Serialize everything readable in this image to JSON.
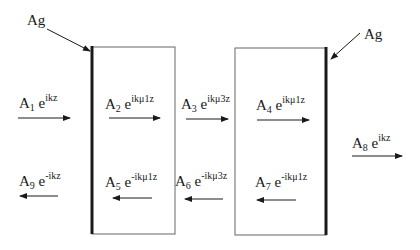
{
  "diagram": {
    "title": "",
    "colors": {
      "stroke": "#1a1a1a",
      "thin_edge": "#555555",
      "background": "#ffffff"
    },
    "slabs": [
      {
        "name": "slab-1",
        "x": 91,
        "y": 47,
        "w": 84,
        "h": 187,
        "thick_edge": "left",
        "coating_label": "Ag"
      },
      {
        "name": "slab-2",
        "x": 235,
        "y": 48,
        "w": 91,
        "h": 187,
        "thick_edge": "right",
        "coating_label": "Ag"
      }
    ],
    "ag_labels": [
      {
        "text": "Ag",
        "x": 26,
        "y": 14
      },
      {
        "text": "Ag",
        "x": 364,
        "y": 28
      }
    ],
    "waves": [
      {
        "id": "A1",
        "amp": "A",
        "sub": "1",
        "exp_base": "e",
        "exp": "ikz",
        "direction": "right",
        "region": "left-medium"
      },
      {
        "id": "A2",
        "amp": "A",
        "sub": "2",
        "exp_base": "e",
        "exp": "ikμ1z",
        "direction": "right",
        "region": "slab-1"
      },
      {
        "id": "A3",
        "amp": "A",
        "sub": "3",
        "exp_base": "e",
        "exp": "ikμ3z",
        "direction": "right",
        "region": "gap"
      },
      {
        "id": "A4",
        "amp": "A",
        "sub": "4",
        "exp_base": "e",
        "exp": "ikμ1z",
        "direction": "right",
        "region": "slab-2"
      },
      {
        "id": "A8",
        "amp": "A",
        "sub": "8",
        "exp_base": "e",
        "exp": "ikz",
        "direction": "right",
        "region": "right-medium"
      },
      {
        "id": "A9",
        "amp": "A",
        "sub": "9",
        "exp_base": "e",
        "exp": "-ikz",
        "direction": "left",
        "region": "left-medium"
      },
      {
        "id": "A5",
        "amp": "A",
        "sub": "5",
        "exp_base": "e",
        "exp": "-ikμ1z",
        "direction": "left",
        "region": "slab-1"
      },
      {
        "id": "A6",
        "amp": "A",
        "sub": "6",
        "exp_base": "e",
        "exp": "-ikμ3z",
        "direction": "left",
        "region": "gap"
      },
      {
        "id": "A7",
        "amp": "A",
        "sub": "7",
        "exp_base": "e",
        "exp": "-ikμ1z",
        "direction": "left",
        "region": "slab-2"
      }
    ]
  }
}
